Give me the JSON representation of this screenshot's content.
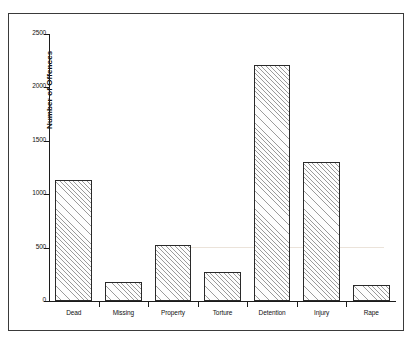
{
  "chart_data": {
    "type": "bar",
    "title": "",
    "xlabel": "",
    "ylabel": "Number of Offences",
    "categories": [
      "Dead",
      "Missing",
      "Property",
      "Torture",
      "Detention",
      "Injury",
      "Rape"
    ],
    "values": [
      1130,
      180,
      520,
      270,
      2210,
      1300,
      150
    ],
    "ylim": [
      0,
      2500
    ],
    "yticks": [
      0,
      500,
      1000,
      1500,
      2000,
      2500
    ],
    "ytick_labels": [
      "0",
      "500",
      "1000",
      "1500",
      "2000",
      "2500"
    ],
    "grid": false,
    "legend": null,
    "bar_style": {
      "fill": "diagonal-hatch",
      "hatch_color": "#9a9a9a",
      "edge_color": "#2a2a2a",
      "background": "#fdfdfd"
    },
    "frame": {
      "border_color": "#3a3a3a",
      "background": "#ffffff"
    },
    "axis_color": "#1c1c1c"
  }
}
